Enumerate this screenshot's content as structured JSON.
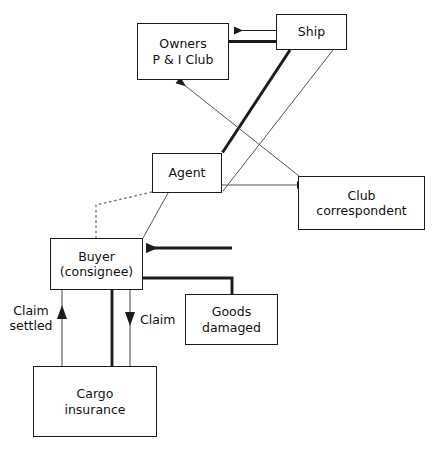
{
  "diagram": {
    "background_color": "#ffffff",
    "line_color": "#1c1c1c",
    "text_color": "#111111",
    "nodes": [
      {
        "id": "owners",
        "label": "Owners\nP & I Club",
        "x": 137,
        "y": 23,
        "w": 92,
        "h": 57
      },
      {
        "id": "ship",
        "label": "Ship",
        "x": 276,
        "y": 14,
        "w": 71,
        "h": 36
      },
      {
        "id": "agent",
        "label": "Agent",
        "x": 152,
        "y": 153,
        "w": 70,
        "h": 40
      },
      {
        "id": "club",
        "label": "Club\ncorrespondent",
        "x": 298,
        "y": 176,
        "w": 127,
        "h": 54
      },
      {
        "id": "buyer",
        "label": "Buyer\n(consignee)",
        "x": 50,
        "y": 238,
        "w": 93,
        "h": 52
      },
      {
        "id": "goods",
        "label": "Goods\ndamaged",
        "x": 185,
        "y": 294,
        "w": 93,
        "h": 51
      },
      {
        "id": "cargo",
        "label": "Cargo\ninsurance",
        "x": 33,
        "y": 366,
        "w": 124,
        "h": 71
      }
    ],
    "edge_labels": [
      {
        "id": "claim-settled",
        "label": "Claim\nsettled",
        "x": 5,
        "y": 303,
        "w": 52
      },
      {
        "id": "claim",
        "label": "Claim",
        "x": 140,
        "y": 312,
        "w": 44
      }
    ],
    "edges": [
      {
        "id": "ship-to-owners-thin",
        "from": "ship",
        "to": "owners",
        "style": "thin",
        "arrow": "left"
      },
      {
        "id": "ship-to-owners-thick",
        "from": "ship",
        "to": "owners",
        "style": "thick",
        "arrow": "none"
      },
      {
        "id": "ship-to-agent",
        "from": "ship",
        "to": "agent",
        "style": "thick",
        "arrow": "none"
      },
      {
        "id": "ship-to-buyer",
        "from": "ship",
        "to": "agent",
        "style": "thin",
        "arrow": "none"
      },
      {
        "id": "club-to-owners",
        "from": "club",
        "to": "owners",
        "style": "thin",
        "arrow": "up-left"
      },
      {
        "id": "agent-to-club",
        "from": "agent",
        "to": "club",
        "style": "thin",
        "arrow": "right"
      },
      {
        "id": "agent-to-ship",
        "from": "agent",
        "to": "ship",
        "style": "thin",
        "arrow": "none"
      },
      {
        "id": "agent-to-buyer-dashed",
        "from": "agent",
        "to": "buyer",
        "style": "dashed",
        "arrow": "none"
      },
      {
        "id": "agent-to-buyer-solid",
        "from": "agent",
        "to": "buyer",
        "style": "thin",
        "arrow": "none"
      },
      {
        "id": "goods-to-buyer-arrow",
        "from": "goods",
        "to": "buyer",
        "style": "thick",
        "arrow": "left"
      },
      {
        "id": "buyer-to-goods",
        "from": "buyer",
        "to": "goods",
        "style": "thick",
        "arrow": "none"
      },
      {
        "id": "cargo-to-buyer-settled",
        "from": "cargo",
        "to": "buyer",
        "style": "thin",
        "arrow": "up"
      },
      {
        "id": "buyer-to-cargo-thick",
        "from": "buyer",
        "to": "cargo",
        "style": "thick",
        "arrow": "none"
      },
      {
        "id": "buyer-to-cargo-claim",
        "from": "buyer",
        "to": "cargo",
        "style": "thin",
        "arrow": "down"
      }
    ]
  }
}
